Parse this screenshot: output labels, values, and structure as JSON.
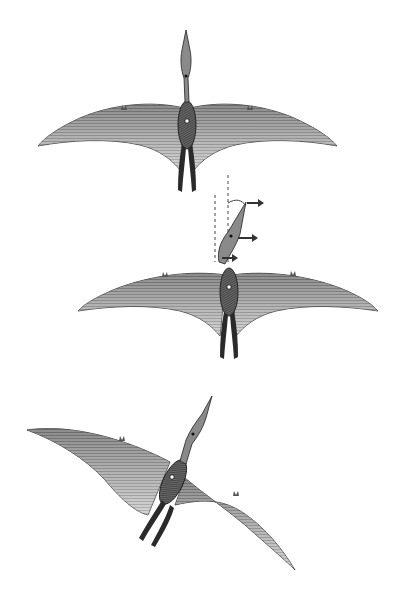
{
  "figure": {
    "type": "scientific-illustration",
    "background": "#ffffff",
    "ink_dark": "#1f1f1f",
    "ink_mid": "#5a5a5a",
    "ink_light": "#9a9a9a",
    "panels": [
      {
        "id": "pose-1",
        "description": "dorsal view, wings fully spread, head forward"
      },
      {
        "id": "pose-2",
        "description": "dorsal view, wings spread, head rotation inset with dashed reference lines and arrows"
      },
      {
        "id": "pose-3",
        "description": "banking turn, body rotated, wings asymmetric"
      }
    ],
    "inset": {
      "dashed_lines": 2,
      "arrows": 3,
      "arrow_direction": "right"
    }
  }
}
